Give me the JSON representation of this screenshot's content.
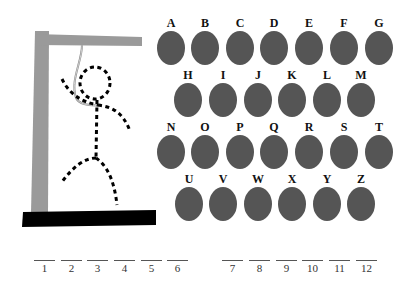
{
  "game": {
    "title": "Hangman",
    "colors": {
      "post": "#9a9a9a",
      "base": "#000000",
      "figure": "#000000",
      "rope": "#8a8a8a",
      "button": "#555555",
      "letter": "#111111"
    },
    "figure_parts_shown": [
      "head",
      "body",
      "left-arm",
      "right-arm",
      "left-leg",
      "right-leg"
    ]
  },
  "keyboard": {
    "rows": [
      [
        "A",
        "B",
        "C",
        "D",
        "E",
        "F",
        "G"
      ],
      [
        "H",
        "I",
        "J",
        "K",
        "L",
        "M"
      ],
      [
        "N",
        "O",
        "P",
        "Q",
        "R",
        "S",
        "T"
      ],
      [
        "U",
        "V",
        "W",
        "X",
        "Y",
        "Z"
      ]
    ]
  },
  "word": {
    "blanks": [
      {
        "index": "1",
        "value": ""
      },
      {
        "index": "2",
        "value": ""
      },
      {
        "index": "3",
        "value": ""
      },
      {
        "index": "4",
        "value": ""
      },
      {
        "index": "5",
        "value": ""
      },
      {
        "index": "6",
        "value": ""
      },
      {
        "index": "7",
        "value": ""
      },
      {
        "index": "8",
        "value": ""
      },
      {
        "index": "9",
        "value": ""
      },
      {
        "index": "10",
        "value": ""
      },
      {
        "index": "11",
        "value": ""
      },
      {
        "index": "12",
        "value": ""
      }
    ]
  }
}
